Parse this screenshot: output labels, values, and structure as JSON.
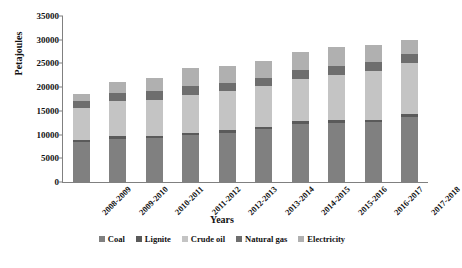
{
  "chart_data": {
    "type": "bar",
    "stacked": true,
    "title": "",
    "xlabel": "Years",
    "ylabel": "Petajoules",
    "ylim": [
      0,
      35000
    ],
    "yticks": [
      0,
      5000,
      10000,
      15000,
      20000,
      25000,
      30000,
      35000
    ],
    "ytick_labels": [
      "0",
      "5000",
      "10000",
      "15000",
      "20000",
      "25000",
      "30000",
      "35000"
    ],
    "grid": false,
    "legend_position": "bottom",
    "categories": [
      "2008-2009",
      "2009-2010",
      "2010-2011",
      "2011-2012",
      "2012-2013",
      "2013-2014",
      "2014-2015",
      "2015-2016",
      "2016-2017",
      "2017-2018"
    ],
    "series": [
      {
        "name": "Coal",
        "color": "#808080",
        "values": [
          8400,
          9100,
          9200,
          9900,
          10400,
          11200,
          12300,
          12500,
          12600,
          13800
        ]
      },
      {
        "name": "Lignite",
        "color": "#5a5a5a",
        "values": [
          500,
          500,
          500,
          500,
          500,
          500,
          500,
          500,
          500,
          500
        ]
      },
      {
        "name": "Crude oil",
        "color": "#c4c4c4",
        "values": [
          6700,
          7400,
          7700,
          8000,
          8300,
          8600,
          9000,
          9500,
          10400,
          10900
        ]
      },
      {
        "name": "Natural gas",
        "color": "#6e6e6e",
        "values": [
          1500,
          1800,
          1900,
          1800,
          1700,
          1700,
          1800,
          1900,
          1900,
          1900
        ]
      },
      {
        "name": "Electricity",
        "color": "#b0b0b0",
        "values": [
          1400,
          2200,
          2700,
          3800,
          3600,
          3600,
          3900,
          4100,
          3600,
          2900
        ]
      }
    ],
    "totals": [
      18500,
      21000,
      22000,
      24000,
      24500,
      25600,
      27500,
      28500,
      29000,
      30000
    ]
  },
  "legend": {
    "items": [
      {
        "label": "Coal"
      },
      {
        "label": "Lignite"
      },
      {
        "label": "Crude oil"
      },
      {
        "label": "Natural gas"
      },
      {
        "label": "Electricity"
      }
    ]
  }
}
